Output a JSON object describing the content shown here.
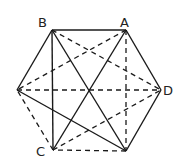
{
  "diagram": {
    "type": "regular hexagon with all diagonals",
    "vertices": {
      "B": {
        "label": "B",
        "x": 52,
        "y": 30
      },
      "A": {
        "label": "A",
        "x": 126,
        "y": 30
      },
      "D": {
        "label": "D",
        "x": 161,
        "y": 90
      },
      "E": {
        "label": "",
        "x": 126,
        "y": 151
      },
      "C": {
        "label": "C",
        "x": 53,
        "y": 150
      },
      "F": {
        "label": "",
        "x": 17,
        "y": 90
      }
    },
    "labels": {
      "A": "A",
      "B": "B",
      "C": "C",
      "D": "D"
    },
    "solid_edges": [
      [
        "B",
        "A"
      ],
      [
        "A",
        "D"
      ],
      [
        "D",
        "E"
      ],
      [
        "F",
        "B"
      ],
      [
        "B",
        "C"
      ],
      [
        "B",
        "E"
      ],
      [
        "A",
        "C"
      ],
      [
        "F",
        "E"
      ]
    ],
    "dashed_edges": [
      [
        "E",
        "C"
      ],
      [
        "C",
        "F"
      ],
      [
        "A",
        "E"
      ],
      [
        "A",
        "F"
      ],
      [
        "B",
        "D"
      ],
      [
        "F",
        "D"
      ],
      [
        "C",
        "D"
      ]
    ]
  }
}
